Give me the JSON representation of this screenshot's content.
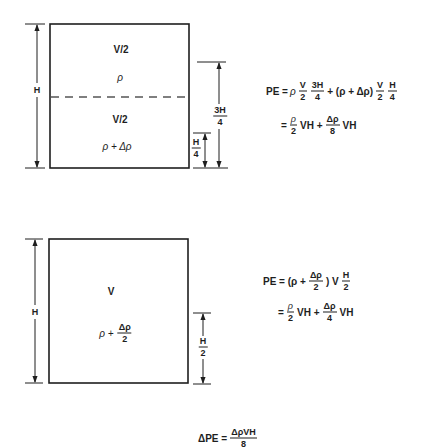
{
  "top_panel": {
    "upper_volume": "V/2",
    "upper_density": "ρ",
    "lower_volume": "V/2",
    "lower_density": "ρ + Δρ",
    "height_label": "H",
    "upper_centroid_height": {
      "num": "3H",
      "den": "4"
    },
    "lower_centroid_height": {
      "num": "H",
      "den": "4"
    },
    "equation_line1": [
      {
        "text": "PE ="
      },
      {
        "text": "ρ"
      },
      {
        "num": "V",
        "den": "2"
      },
      {
        "num": "3H",
        "den": "4"
      },
      {
        "text": "+ (ρ + Δρ)"
      },
      {
        "num": "V",
        "den": "2"
      },
      {
        "num": "H",
        "den": "4"
      }
    ],
    "equation_line2": [
      {
        "text": "="
      },
      {
        "num": "ρ",
        "den": "2"
      },
      {
        "text": "VH +"
      },
      {
        "num": "Δρ",
        "den": "8"
      },
      {
        "text": "VH"
      }
    ]
  },
  "bottom_panel": {
    "volume": "V",
    "density_prefix": "ρ +",
    "density_fraction": {
      "num": "Δρ",
      "den": "2"
    },
    "height_label": "H",
    "centroid_height": {
      "num": "H",
      "den": "2"
    },
    "equation_line1": [
      {
        "text": "PE = (ρ +"
      },
      {
        "num": "Δρ",
        "den": "2"
      },
      {
        "text": ") V"
      },
      {
        "num": "H",
        "den": "2"
      }
    ],
    "equation_line2": [
      {
        "text": "="
      },
      {
        "num": "ρ",
        "den": "2"
      },
      {
        "text": "VH +"
      },
      {
        "num": "Δρ",
        "den": "4"
      },
      {
        "text": "VH"
      }
    ]
  },
  "result": {
    "lhs": "ΔPE =",
    "num": "ΔρVH",
    "den": "8"
  }
}
